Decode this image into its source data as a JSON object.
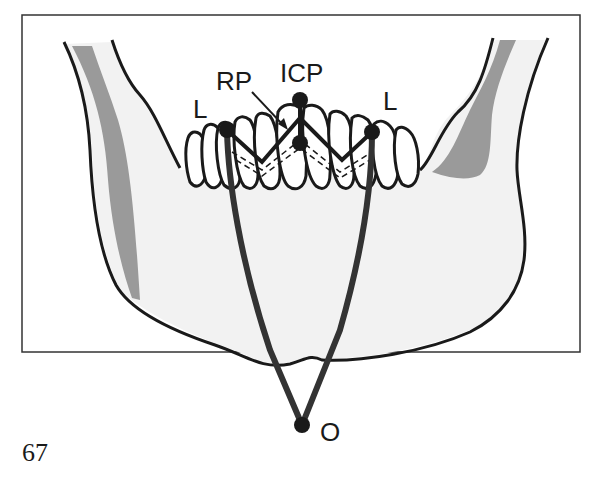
{
  "figure": {
    "number": "67",
    "labels": {
      "rp": "RP",
      "icp": "ICP",
      "lateral_left": "L",
      "lateral_right": "L",
      "origin": "O"
    },
    "colors": {
      "bone_fill": "#f2f2f2",
      "ramus_shade": "#999999",
      "outline": "#1a1a1a",
      "frame": "#333333"
    }
  }
}
